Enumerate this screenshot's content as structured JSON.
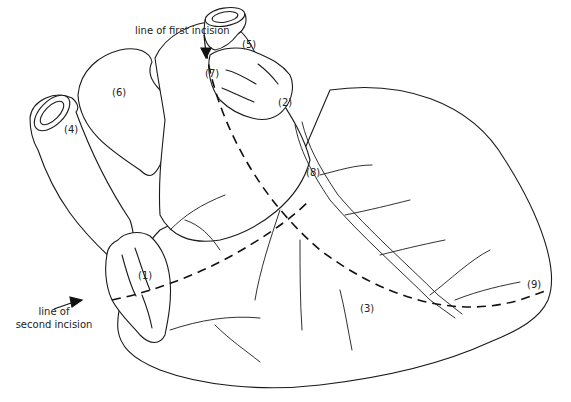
{
  "figure": {
    "annotations": {
      "first_incision": "line of first incision",
      "second_incision_line1": "line of",
      "second_incision_line2": "second incision"
    },
    "region_labels": [
      {
        "id": "1",
        "text": "(1)"
      },
      {
        "id": "2",
        "text": "(2)"
      },
      {
        "id": "3",
        "text": "(3)"
      },
      {
        "id": "4",
        "text": "(4)"
      },
      {
        "id": "5",
        "text": "(5)"
      },
      {
        "id": "6",
        "text": "(6)"
      },
      {
        "id": "7",
        "text": "(7)"
      },
      {
        "id": "8",
        "text": "(8)"
      },
      {
        "id": "9",
        "text": "(9)"
      }
    ],
    "colors": {
      "line": "#1a1a1a",
      "background": "#ffffff"
    }
  }
}
